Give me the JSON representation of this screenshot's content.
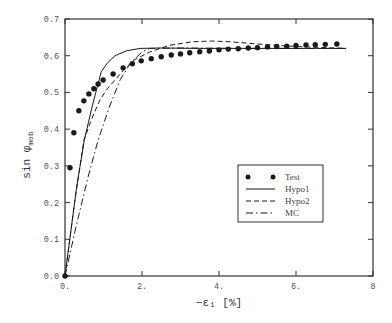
{
  "chart_data": {
    "type": "line",
    "title": "",
    "xlabel": "−ε₁ [%]",
    "ylabel": "sin φmob",
    "ylabel_main": "sin φ",
    "ylabel_sub": "mob",
    "xlim": [
      0,
      8
    ],
    "ylim": [
      0,
      0.7
    ],
    "xticks": [
      0,
      2,
      4,
      6,
      8
    ],
    "xtick_labels": [
      "0.",
      "2.",
      "4.",
      "6.",
      "8"
    ],
    "yticks": [
      0.0,
      0.1,
      0.2,
      0.3,
      0.4,
      0.5,
      0.6,
      0.7
    ],
    "ytick_labels": [
      "0.0",
      "0.1",
      "0.2",
      "0.3",
      "0.4",
      "0.5",
      "0.6",
      "0.7"
    ],
    "grid": false,
    "legend_position": "lower right (inside)",
    "series": [
      {
        "name": "Test",
        "style": "markers",
        "x": [
          0.0,
          0.13,
          0.23,
          0.36,
          0.49,
          0.62,
          0.75,
          0.86,
          0.99,
          1.25,
          1.51,
          1.75,
          1.98,
          2.24,
          2.5,
          2.76,
          3.0,
          3.24,
          3.5,
          3.75,
          4.0,
          4.24,
          4.5,
          4.76,
          5.0,
          5.26,
          5.5,
          5.76,
          6.0,
          6.26,
          6.5,
          6.76,
          7.06
        ],
        "y": [
          0.0,
          0.295,
          0.39,
          0.45,
          0.477,
          0.496,
          0.51,
          0.523,
          0.534,
          0.55,
          0.567,
          0.578,
          0.586,
          0.592,
          0.597,
          0.602,
          0.605,
          0.608,
          0.611,
          0.613,
          0.616,
          0.618,
          0.619,
          0.621,
          0.622,
          0.624,
          0.625,
          0.626,
          0.628,
          0.629,
          0.63,
          0.631,
          0.632
        ]
      },
      {
        "name": "Hypo1",
        "style": "solid",
        "x": [
          0.0,
          0.3,
          0.5,
          0.7,
          0.94,
          1.1,
          1.3,
          1.59,
          1.95,
          2.5,
          3.5,
          5.0,
          6.5,
          7.3
        ],
        "y": [
          0.0,
          0.24,
          0.37,
          0.46,
          0.556,
          0.58,
          0.6,
          0.613,
          0.62,
          0.621,
          0.62,
          0.62,
          0.62,
          0.62
        ]
      },
      {
        "name": "Hypo2",
        "style": "dashed",
        "x": [
          0.0,
          0.25,
          0.49,
          0.7,
          0.91,
          1.1,
          1.3,
          1.55,
          1.82,
          2.2,
          2.7,
          3.3,
          3.8,
          4.3,
          5.0,
          6.0,
          7.3
        ],
        "y": [
          0.0,
          0.2,
          0.37,
          0.43,
          0.48,
          0.51,
          0.534,
          0.565,
          0.59,
          0.61,
          0.628,
          0.638,
          0.64,
          0.638,
          0.632,
          0.625,
          0.62
        ]
      },
      {
        "name": "MC",
        "style": "dashdot",
        "x": [
          0.0,
          0.3,
          0.6,
          0.86,
          1.15,
          1.43,
          1.7,
          2.0,
          2.2,
          3.0,
          4.5,
          6.0,
          7.3
        ],
        "y": [
          0.0,
          0.14,
          0.27,
          0.37,
          0.46,
          0.534,
          0.58,
          0.61,
          0.62,
          0.621,
          0.62,
          0.62,
          0.62
        ]
      }
    ]
  },
  "legend": {
    "items": [
      {
        "label": "Test",
        "style": "markers"
      },
      {
        "label": "Hypo1",
        "style": "solid"
      },
      {
        "label": "Hypo2",
        "style": "dashed"
      },
      {
        "label": "MC",
        "style": "dashdot"
      }
    ]
  },
  "colors": {
    "line": "#1a1a1a",
    "axis": "#333333",
    "text": "#555555"
  }
}
